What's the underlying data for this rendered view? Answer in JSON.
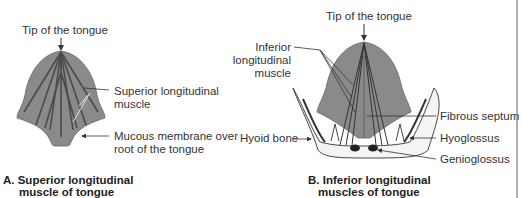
{
  "panel_a": {
    "labels": {
      "tip": "Tip of the tongue",
      "superior_1": "Superior longitudinal",
      "superior_2": "muscle",
      "mucous_1": "Mucous membrane over",
      "mucous_2": "root of the tongue"
    },
    "caption_1": "A. Superior longitudinal",
    "caption_2": "muscle of tongue"
  },
  "panel_b": {
    "labels": {
      "tip": "Tip of the tongue",
      "inferior_1": "Inferior",
      "inferior_2": "longitudinal",
      "inferior_3": "muscle",
      "hyoid": "Hyoid bone",
      "septum": "Fibrous septum",
      "hyoglossus": "Hyoglossus",
      "genioglossus": "Genioglossus"
    },
    "caption_1": "B. Inferior longitudinal",
    "caption_2": "muscles of tongue"
  },
  "colors": {
    "tongue_fill": "#8a8a8a",
    "muscle_line": "#4a4a4a",
    "bone_fill": "#f4f4f4",
    "line": "#333333"
  }
}
